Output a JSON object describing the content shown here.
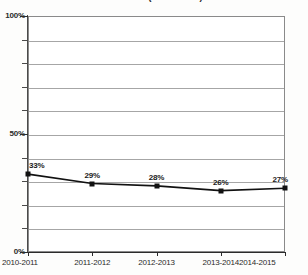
{
  "chart_data": {
    "type": "line",
    "title": "Gráfico 1 (Gráfico 2.1)",
    "xlabel": "",
    "ylabel": "",
    "categories": [
      "2010-2011",
      "2011-2012",
      "2012-2013",
      "2013-2014",
      "2014-2015"
    ],
    "values": [
      33,
      29,
      28,
      26,
      27
    ],
    "point_labels": [
      "33%",
      "29%",
      "28%",
      "26%",
      "27%"
    ],
    "ylim": [
      0,
      100
    ],
    "ytick_labels": [
      "0%",
      "50%",
      "100%"
    ],
    "ytick_values": [
      0,
      50,
      100
    ],
    "gridline_values": [
      10,
      20,
      30,
      40,
      50,
      60,
      70,
      80,
      90
    ],
    "grid": true,
    "legend": "none",
    "series_color": "#111111",
    "gridline_color": "#a6a6a6",
    "axis_color": "#2b2b2b"
  }
}
